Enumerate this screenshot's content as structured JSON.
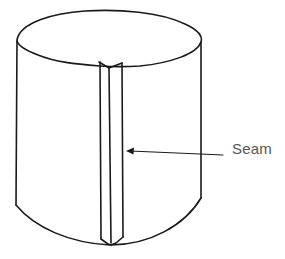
{
  "diagram": {
    "labels": {
      "seam": "Seam"
    },
    "colors": {
      "line": "#1a1a1a",
      "label_text": "#555555",
      "background": "#ffffff"
    },
    "callouts": [
      {
        "target": "seam-strip",
        "label": "Seam",
        "arrow_direction": "left"
      }
    ]
  }
}
